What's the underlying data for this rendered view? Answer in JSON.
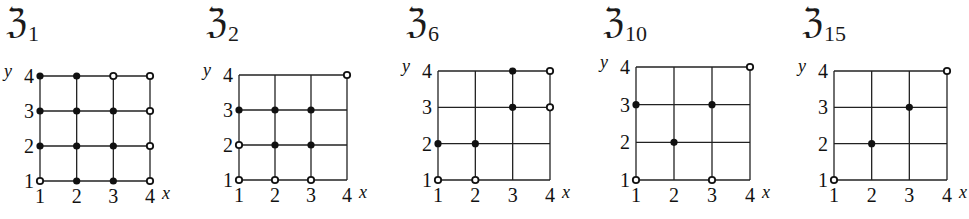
{
  "figure": {
    "panels": [
      {
        "title_symbol": "ℨ",
        "title_subscript": "1",
        "left": 0,
        "grid": {
          "x0": 40,
          "x1": 150,
          "y_top": 76,
          "y_bottom": 181
        },
        "points": [
          {
            "x": 1,
            "y": 4,
            "filled": true
          },
          {
            "x": 2,
            "y": 4,
            "filled": true
          },
          {
            "x": 3,
            "y": 4,
            "filled": false
          },
          {
            "x": 4,
            "y": 4,
            "filled": false
          },
          {
            "x": 1,
            "y": 3,
            "filled": true
          },
          {
            "x": 2,
            "y": 3,
            "filled": true
          },
          {
            "x": 3,
            "y": 3,
            "filled": true
          },
          {
            "x": 4,
            "y": 3,
            "filled": false
          },
          {
            "x": 1,
            "y": 2,
            "filled": true
          },
          {
            "x": 2,
            "y": 2,
            "filled": true
          },
          {
            "x": 3,
            "y": 2,
            "filled": true
          },
          {
            "x": 4,
            "y": 2,
            "filled": false
          },
          {
            "x": 1,
            "y": 1,
            "filled": false
          },
          {
            "x": 2,
            "y": 1,
            "filled": true
          },
          {
            "x": 3,
            "y": 1,
            "filled": true
          },
          {
            "x": 4,
            "y": 1,
            "filled": false
          }
        ]
      },
      {
        "title_symbol": "ℨ",
        "title_subscript": "2",
        "left": 200,
        "grid": {
          "x0": 239,
          "x1": 347,
          "y_top": 75,
          "y_bottom": 180
        },
        "points": [
          {
            "x": 4,
            "y": 4,
            "filled": false
          },
          {
            "x": 1,
            "y": 3,
            "filled": true
          },
          {
            "x": 2,
            "y": 3,
            "filled": true
          },
          {
            "x": 3,
            "y": 3,
            "filled": true
          },
          {
            "x": 1,
            "y": 2,
            "filled": false
          },
          {
            "x": 2,
            "y": 2,
            "filled": true
          },
          {
            "x": 3,
            "y": 2,
            "filled": true
          },
          {
            "x": 1,
            "y": 1,
            "filled": false
          },
          {
            "x": 2,
            "y": 1,
            "filled": false
          },
          {
            "x": 3,
            "y": 1,
            "filled": false
          }
        ]
      },
      {
        "title_symbol": "ℨ",
        "title_subscript": "6",
        "left": 400,
        "grid": {
          "x0": 438,
          "x1": 550,
          "y_top": 71,
          "y_bottom": 180
        },
        "points": [
          {
            "x": 3,
            "y": 4,
            "filled": true
          },
          {
            "x": 4,
            "y": 4,
            "filled": false
          },
          {
            "x": 3,
            "y": 3,
            "filled": true
          },
          {
            "x": 4,
            "y": 3,
            "filled": false
          },
          {
            "x": 1,
            "y": 2,
            "filled": true
          },
          {
            "x": 2,
            "y": 2,
            "filled": true
          },
          {
            "x": 1,
            "y": 1,
            "filled": false
          },
          {
            "x": 2,
            "y": 1,
            "filled": false
          }
        ]
      },
      {
        "title_symbol": "ℨ",
        "title_subscript": "10",
        "left": 597,
        "grid": {
          "x0": 636,
          "x1": 750,
          "y_top": 67,
          "y_bottom": 180
        },
        "points": [
          {
            "x": 4,
            "y": 4,
            "filled": false
          },
          {
            "x": 1,
            "y": 3,
            "filled": true
          },
          {
            "x": 3,
            "y": 3,
            "filled": true
          },
          {
            "x": 2,
            "y": 2,
            "filled": true
          },
          {
            "x": 1,
            "y": 1,
            "filled": false
          },
          {
            "x": 3,
            "y": 1,
            "filled": false
          }
        ]
      },
      {
        "title_symbol": "ℨ",
        "title_subscript": "15",
        "left": 796,
        "grid": {
          "x0": 834,
          "x1": 947,
          "y_top": 71,
          "y_bottom": 180
        },
        "points": [
          {
            "x": 4,
            "y": 4,
            "filled": false
          },
          {
            "x": 3,
            "y": 3,
            "filled": true
          },
          {
            "x": 2,
            "y": 2,
            "filled": true
          },
          {
            "x": 1,
            "y": 1,
            "filled": false
          }
        ]
      }
    ],
    "axis": {
      "x_label": "x",
      "y_label": "y",
      "x_ticks": [
        "1",
        "2",
        "3",
        "4"
      ],
      "y_ticks": [
        "1",
        "2",
        "3",
        "4"
      ]
    },
    "colors": {
      "line": "#222222",
      "dot": "#111111",
      "background": "#ffffff"
    }
  }
}
